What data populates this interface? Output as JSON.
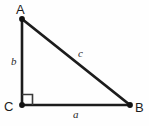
{
  "figure": {
    "type": "right-triangle-diagram",
    "background_color": "#fefefe",
    "stroke_color": "#1c1c1c",
    "vertices": [
      {
        "id": "A",
        "label": "A",
        "x": 22,
        "y": 19,
        "label_x": 16,
        "label_y": 3
      },
      {
        "id": "B",
        "label": "B",
        "x": 130,
        "y": 105,
        "label_x": 135,
        "label_y": 101
      },
      {
        "id": "C",
        "label": "C",
        "x": 22,
        "y": 105,
        "label_x": 4,
        "label_y": 100
      }
    ],
    "sides": [
      {
        "id": "a",
        "label": "a",
        "from": "C",
        "to": "B",
        "role": "base-leg",
        "label_x": 73,
        "label_y": 109
      },
      {
        "id": "b",
        "label": "b",
        "from": "C",
        "to": "A",
        "role": "vertical-leg",
        "label_x": 11,
        "label_y": 56
      },
      {
        "id": "c",
        "label": "c",
        "from": "A",
        "to": "B",
        "role": "hypotenuse",
        "label_x": 78,
        "label_y": 48
      }
    ],
    "right_angle": {
      "at_vertex": "C",
      "marker": "square",
      "size": 10,
      "x": 22,
      "y": 95
    }
  }
}
